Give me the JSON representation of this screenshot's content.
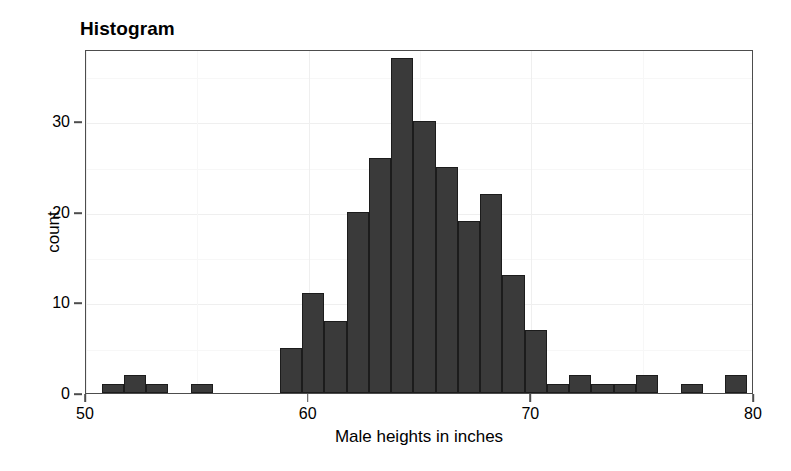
{
  "chart_data": {
    "type": "bar",
    "title": "Histogram",
    "xlabel": "Male heights in inches",
    "ylabel": "count",
    "xlim": [
      50,
      80
    ],
    "ylim": [
      0,
      38
    ],
    "xticks": [
      50,
      60,
      70,
      80
    ],
    "xtick_labels": [
      "50",
      "60",
      "70",
      "80"
    ],
    "yticks": [
      0,
      10,
      20,
      30
    ],
    "ytick_labels": [
      "0",
      "10",
      "20",
      "30"
    ],
    "grid": true,
    "legend": "none",
    "bin_width": 1,
    "bar_color": "#3a3a3a",
    "bar_edge_color": "#1c1c1c",
    "panel_border_color": "#4d4d4d",
    "grid_color": "#efefef",
    "background": "#ffffff",
    "bins": [
      {
        "x": 50.7,
        "value": 1
      },
      {
        "x": 51.7,
        "value": 2
      },
      {
        "x": 52.7,
        "value": 1
      },
      {
        "x": 54.7,
        "value": 1
      },
      {
        "x": 58.7,
        "value": 5
      },
      {
        "x": 59.7,
        "value": 11
      },
      {
        "x": 60.7,
        "value": 8
      },
      {
        "x": 61.7,
        "value": 20
      },
      {
        "x": 62.7,
        "value": 26
      },
      {
        "x": 63.7,
        "value": 37
      },
      {
        "x": 64.7,
        "value": 30
      },
      {
        "x": 65.7,
        "value": 25
      },
      {
        "x": 66.7,
        "value": 19
      },
      {
        "x": 67.7,
        "value": 22
      },
      {
        "x": 68.7,
        "value": 13
      },
      {
        "x": 69.7,
        "value": 7
      },
      {
        "x": 70.7,
        "value": 1
      },
      {
        "x": 71.7,
        "value": 2
      },
      {
        "x": 72.7,
        "value": 1
      },
      {
        "x": 73.7,
        "value": 1
      },
      {
        "x": 74.7,
        "value": 2
      },
      {
        "x": 76.7,
        "value": 1
      },
      {
        "x": 78.7,
        "value": 2
      }
    ],
    "categories": [
      "50.7",
      "51.7",
      "52.7",
      "54.7",
      "58.7",
      "59.7",
      "60.7",
      "61.7",
      "62.7",
      "63.7",
      "64.7",
      "65.7",
      "66.7",
      "67.7",
      "68.7",
      "69.7",
      "70.7",
      "71.7",
      "72.7",
      "73.7",
      "74.7",
      "76.7",
      "78.7"
    ],
    "values": [
      1,
      2,
      1,
      1,
      5,
      11,
      8,
      20,
      26,
      37,
      30,
      25,
      19,
      22,
      13,
      7,
      1,
      2,
      1,
      1,
      2,
      1,
      2
    ]
  }
}
